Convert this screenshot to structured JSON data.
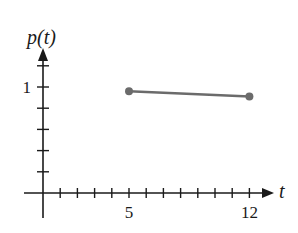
{
  "chart_data": {
    "type": "line",
    "title": "",
    "xlabel": "t",
    "ylabel": "p(t)",
    "x_tick_labels": [
      {
        "value": 5,
        "label": "5"
      },
      {
        "value": 12,
        "label": "12"
      }
    ],
    "y_tick_labels": [
      {
        "value": 1,
        "label": "1"
      }
    ],
    "x_minor_tick_step": 1,
    "y_minor_tick_step": 0.2,
    "xlim": [
      0,
      13
    ],
    "ylim": [
      0,
      1.3
    ],
    "grid": false,
    "legend": null,
    "series": [
      {
        "name": "p(t)",
        "color": "#6b6b6b",
        "marker": "circle",
        "x": [
          5,
          12
        ],
        "y": [
          0.96,
          0.91
        ]
      }
    ]
  },
  "colors": {
    "axis": "#1a1a1a",
    "series": "#6b6b6b",
    "background": "#ffffff"
  }
}
